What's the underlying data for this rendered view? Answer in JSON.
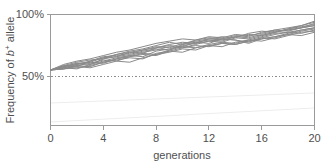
{
  "chart_data": {
    "type": "line",
    "title": "",
    "xlabel": "generations",
    "ylabel": "Frequency of b+ allele",
    "ylabel_parts": {
      "prefix": "Frequency of ",
      "italic_symbol": "b",
      "superscript": "+",
      "suffix": " allele"
    },
    "x": [
      0,
      1,
      2,
      3,
      4,
      5,
      6,
      7,
      8,
      9,
      10,
      11,
      12,
      13,
      14,
      15,
      16,
      17,
      18,
      19,
      20
    ],
    "xlim": [
      0,
      20
    ],
    "ylim": [
      0,
      100
    ],
    "xticks": [
      0,
      4,
      8,
      12,
      16,
      20
    ],
    "xtick_labels": [
      "0",
      "4",
      "8",
      "12",
      "16",
      "20"
    ],
    "yticks": [
      50,
      100
    ],
    "ytick_labels": [
      "50%",
      "100%"
    ],
    "grid": false,
    "legend": false,
    "reference_line": {
      "y": 50,
      "style": "dotted",
      "label": ""
    },
    "line_color": "#8a8a8a",
    "axis_color": "#9a9a9a",
    "background_color": "#ffffff",
    "series": [
      {
        "name": "replicate-1",
        "values": [
          50,
          53,
          56,
          57,
          61,
          62,
          66,
          68,
          71,
          70,
          74,
          76,
          78,
          77,
          80,
          79,
          82,
          85,
          86,
          88,
          92
        ]
      },
      {
        "name": "replicate-2",
        "values": [
          50,
          52,
          54,
          53,
          57,
          60,
          62,
          65,
          64,
          68,
          71,
          70,
          73,
          75,
          74,
          77,
          80,
          83,
          84,
          86,
          88
        ]
      },
      {
        "name": "replicate-3",
        "values": [
          50,
          54,
          57,
          59,
          60,
          64,
          67,
          69,
          72,
          75,
          73,
          77,
          79,
          78,
          81,
          80,
          84,
          86,
          85,
          88,
          90
        ]
      },
      {
        "name": "replicate-4",
        "values": [
          50,
          51,
          53,
          52,
          55,
          58,
          57,
          61,
          64,
          66,
          69,
          68,
          72,
          74,
          73,
          76,
          78,
          80,
          82,
          85,
          87
        ]
      },
      {
        "name": "replicate-5",
        "values": [
          50,
          53,
          55,
          58,
          62,
          63,
          65,
          68,
          70,
          72,
          71,
          75,
          74,
          78,
          77,
          75,
          79,
          82,
          84,
          83,
          86
        ]
      },
      {
        "name": "replicate-6",
        "values": [
          50,
          52,
          51,
          55,
          58,
          61,
          63,
          62,
          67,
          69,
          72,
          74,
          76,
          75,
          79,
          78,
          81,
          84,
          86,
          88,
          90
        ]
      },
      {
        "name": "replicate-7",
        "values": [
          50,
          55,
          58,
          60,
          63,
          66,
          68,
          71,
          74,
          76,
          78,
          77,
          80,
          79,
          82,
          81,
          83,
          86,
          88,
          90,
          94
        ]
      },
      {
        "name": "replicate-8",
        "values": [
          50,
          51,
          54,
          56,
          59,
          58,
          62,
          64,
          63,
          67,
          70,
          72,
          71,
          74,
          73,
          76,
          79,
          78,
          81,
          84,
          85
        ]
      },
      {
        "name": "replicate-9",
        "values": [
          50,
          53,
          56,
          55,
          60,
          62,
          64,
          67,
          69,
          68,
          73,
          75,
          77,
          76,
          80,
          82,
          81,
          84,
          87,
          89,
          91
        ]
      },
      {
        "name": "replicate-10",
        "values": [
          50,
          52,
          55,
          57,
          56,
          60,
          63,
          66,
          68,
          71,
          70,
          73,
          76,
          78,
          77,
          74,
          78,
          80,
          83,
          86,
          88
        ]
      },
      {
        "name": "replicate-11",
        "values": [
          50,
          54,
          53,
          58,
          61,
          64,
          66,
          65,
          70,
          73,
          75,
          74,
          78,
          80,
          79,
          83,
          85,
          84,
          87,
          90,
          93
        ]
      },
      {
        "name": "replicate-12",
        "values": [
          50,
          51,
          52,
          54,
          57,
          59,
          61,
          60,
          65,
          67,
          66,
          70,
          72,
          71,
          75,
          77,
          76,
          79,
          82,
          81,
          84
        ]
      }
    ],
    "notes": {
      "start_value": 50,
      "end_range": [
        84,
        94
      ],
      "replicate_count": 12
    }
  }
}
